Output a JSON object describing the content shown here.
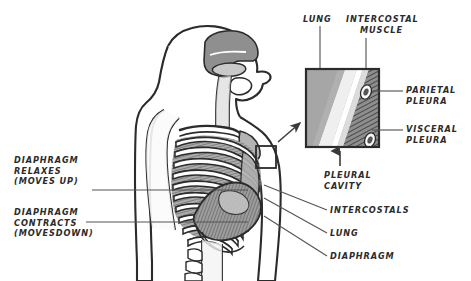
{
  "figure": {
    "title_visible": false,
    "background": "#ffffff",
    "ink": "#2b2b2b",
    "style": "hand-drawn anatomical illustration"
  },
  "colors": {
    "outline": "#2b2b2b",
    "tissue_gray": "#9a9a9a",
    "tissue_light": "#c9c9c9",
    "bone_white": "#fdfdfd",
    "muscle_hatch": "#6e6e6e",
    "lung_fill": "#a6a6a6",
    "leader_line": "#555555"
  },
  "left_labels": [
    {
      "name": "diaphragm-relaxes",
      "lines": [
        "DIAPHRAGM",
        "RELAXES",
        "(MOVES UP)"
      ],
      "x": 14,
      "y": 155,
      "leader": {
        "x1": 92,
        "y1": 190,
        "x2": 248,
        "y2": 190
      }
    },
    {
      "name": "diaphragm-contracts",
      "lines": [
        "DIAPHRAGM",
        "CONTRACTS",
        "(MOVESDOWN)"
      ],
      "x": 14,
      "y": 207,
      "leader": {
        "x1": 86,
        "y1": 222,
        "x2": 248,
        "y2": 222
      }
    }
  ],
  "inset_labels": [
    {
      "name": "lung-inset",
      "lines": [
        "LUNG"
      ],
      "x": 303,
      "y": 14,
      "leader": {
        "x1": 320,
        "y1": 26,
        "x2": 320,
        "y2": 68
      }
    },
    {
      "name": "intercostal-muscle",
      "lines": [
        "INTERCOSTAL",
        "MUSCLE"
      ],
      "x": 346,
      "y": 14,
      "leader": {
        "x1": 366,
        "y1": 38,
        "x2": 366,
        "y2": 68
      }
    },
    {
      "name": "parietal-pleura",
      "lines": [
        "PARIETAL",
        "PLEURA"
      ],
      "x": 406,
      "y": 85,
      "leader": {
        "x1": 400,
        "y1": 91,
        "x2": 372,
        "y2": 91
      }
    },
    {
      "name": "visceral-pleura",
      "lines": [
        "VISCERAL",
        "PLEURA"
      ],
      "x": 406,
      "y": 124,
      "leader": {
        "x1": 400,
        "y1": 130,
        "x2": 372,
        "y2": 130
      }
    },
    {
      "name": "pleural-cavity",
      "lines": [
        "PLEURAL",
        "CAVITY"
      ],
      "x": 324,
      "y": 170,
      "leader": {
        "x1": 340,
        "y1": 166,
        "x2": 340,
        "y2": 150
      }
    }
  ],
  "body_labels": [
    {
      "name": "intercostals",
      "lines": [
        "INTERCOSTALS"
      ],
      "x": 330,
      "y": 208,
      "leader": {
        "x1": 326,
        "y1": 212,
        "x2": 262,
        "y2": 186
      }
    },
    {
      "name": "lung",
      "lines": [
        "LUNG"
      ],
      "x": 330,
      "y": 231,
      "leader": {
        "x1": 326,
        "y1": 235,
        "x2": 262,
        "y2": 199
      }
    },
    {
      "name": "diaphragm",
      "lines": [
        "DIAPHRAGM"
      ],
      "x": 330,
      "y": 254,
      "leader": {
        "x1": 326,
        "y1": 257,
        "x2": 262,
        "y2": 216
      }
    }
  ],
  "inset_box": {
    "name": "pleura-magnified-inset",
    "x": 305,
    "y": 68,
    "width": 75,
    "height": 80,
    "regions": [
      {
        "name": "lung-region",
        "fill": "#a6a6a6",
        "desc": "gray lung tissue filling left portion"
      },
      {
        "name": "visceral-pleura-band",
        "fill": "#f2f2f2",
        "desc": "thin white band"
      },
      {
        "name": "pleural-cavity-gap",
        "fill": "#ffffff",
        "desc": "narrow white gap"
      },
      {
        "name": "parietal-pleura-band",
        "fill": "#e0e0e0",
        "desc": "thin light band"
      },
      {
        "name": "intercostal-muscle-hatch",
        "fill": "#6e6e6e",
        "desc": "diagonal hatched muscle band on right"
      }
    ],
    "rib_ovals": [
      {
        "cx": 366,
        "cy": 92,
        "rx": 5,
        "ry": 7
      },
      {
        "cx": 370,
        "cy": 141,
        "rx": 5,
        "ry": 7
      }
    ]
  },
  "callout_rect": {
    "name": "torso-magnify-region",
    "x": 256,
    "y": 146,
    "width": 20,
    "height": 22
  },
  "callout_arrow": {
    "name": "magnify-arrow",
    "from": {
      "x": 278,
      "y": 142
    },
    "to": {
      "x": 302,
      "y": 122
    }
  },
  "torso": {
    "name": "human-torso-sagittal",
    "description": "Side view of head, neck, shoulder and ribcage showing nasal cavity, pharynx, clavicle, scapula, ribs with intercostal muscles, lung and domed diaphragm",
    "rib_count": 10
  }
}
